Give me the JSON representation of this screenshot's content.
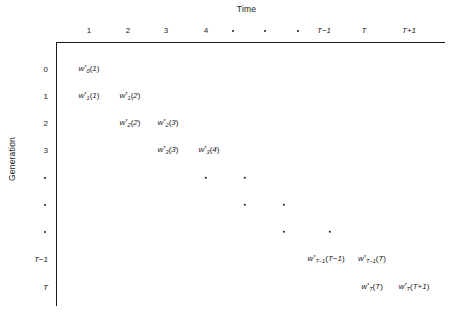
{
  "figure": {
    "x_axis_title": "Time",
    "y_axis_title": "Generation"
  },
  "columns": [
    {
      "label": "1",
      "x": 89,
      "italic": false,
      "is_dot": false
    },
    {
      "label": "2",
      "x": 128,
      "italic": false,
      "is_dot": false
    },
    {
      "label": "3",
      "x": 166,
      "italic": false,
      "is_dot": false
    },
    {
      "label": "4",
      "x": 206,
      "italic": false,
      "is_dot": false
    },
    {
      "label": "",
      "x": 233,
      "italic": false,
      "is_dot": true
    },
    {
      "label": "",
      "x": 265,
      "italic": false,
      "is_dot": true
    },
    {
      "label": "",
      "x": 298,
      "italic": false,
      "is_dot": true
    },
    {
      "label": "T−1",
      "x": 324,
      "italic": true,
      "is_dot": false
    },
    {
      "label": "T",
      "x": 364,
      "italic": true,
      "is_dot": false
    },
    {
      "label": "T+1",
      "x": 409,
      "italic": true,
      "is_dot": false
    }
  ],
  "rows": [
    {
      "label": "0",
      "y": 69,
      "italic": false,
      "is_dot": false
    },
    {
      "label": "1",
      "y": 96,
      "italic": false,
      "is_dot": false
    },
    {
      "label": "2",
      "y": 123,
      "italic": false,
      "is_dot": false
    },
    {
      "label": "3",
      "y": 150,
      "italic": false,
      "is_dot": false
    },
    {
      "label": "",
      "y": 178,
      "italic": false,
      "is_dot": true
    },
    {
      "label": "",
      "y": 205,
      "italic": false,
      "is_dot": true
    },
    {
      "label": "",
      "y": 232,
      "italic": false,
      "is_dot": true
    },
    {
      "label": "T−1",
      "y": 259,
      "italic": true,
      "is_dot": false
    },
    {
      "label": "T",
      "y": 287,
      "italic": true,
      "is_dot": false
    }
  ],
  "cells": [
    {
      "symbol": "w",
      "sup": "*",
      "sub": "0",
      "arg": "1",
      "x": 89,
      "y": 69
    },
    {
      "symbol": "w",
      "sup": "*",
      "sub": "1",
      "arg": "1",
      "x": 89,
      "y": 96
    },
    {
      "symbol": "w",
      "sup": "*",
      "sub": "1",
      "arg": "2",
      "x": 130,
      "y": 96
    },
    {
      "symbol": "w",
      "sup": "*",
      "sub": "2",
      "arg": "2",
      "x": 130,
      "y": 123
    },
    {
      "symbol": "w",
      "sup": "*",
      "sub": "2",
      "arg": "3",
      "x": 168,
      "y": 123
    },
    {
      "symbol": "w",
      "sup": "*",
      "sub": "3",
      "arg": "3",
      "x": 168,
      "y": 150
    },
    {
      "symbol": "w",
      "sup": "*",
      "sub": "3",
      "arg": "4",
      "x": 209,
      "y": 150
    },
    {
      "symbol": "w",
      "sup": "*",
      "sub": "T−1",
      "arg": "T−1",
      "x": 326,
      "y": 259
    },
    {
      "symbol": "w",
      "sup": "*",
      "sub": "T−1",
      "arg": "T",
      "x": 372,
      "y": 259
    },
    {
      "symbol": "w",
      "sup": "*",
      "sub": "T",
      "arg": "T",
      "x": 372,
      "y": 287
    },
    {
      "symbol": "w",
      "sup": "*",
      "sub": "T",
      "arg": "T+1",
      "x": 414,
      "y": 287
    }
  ],
  "grid_dots": [
    {
      "x": 206,
      "y": 178
    },
    {
      "x": 245,
      "y": 178
    },
    {
      "x": 245,
      "y": 205
    },
    {
      "x": 284,
      "y": 205
    },
    {
      "x": 284,
      "y": 232
    },
    {
      "x": 330,
      "y": 232
    }
  ]
}
